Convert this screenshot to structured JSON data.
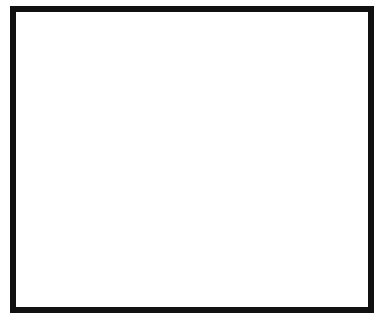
{
  "diagram": {
    "title": "",
    "frame": {
      "border_color": "#111111",
      "background": "#ffffff"
    },
    "tubes": [
      {
        "label": "A",
        "charge_symbol": "−",
        "charge_count": 2,
        "charge_y": [
          131,
          171
        ]
      },
      {
        "label": "B",
        "charge_symbol": "−",
        "charge_count": 6,
        "charge_y": [
          62,
          99,
          135,
          171,
          206,
          243
        ]
      },
      {
        "label": "C",
        "charge_symbol": "−",
        "charge_count": 12,
        "charge_y": [
          59,
          76,
          94,
          111,
          129,
          146,
          164,
          181,
          199,
          216,
          234,
          251
        ]
      }
    ]
  }
}
